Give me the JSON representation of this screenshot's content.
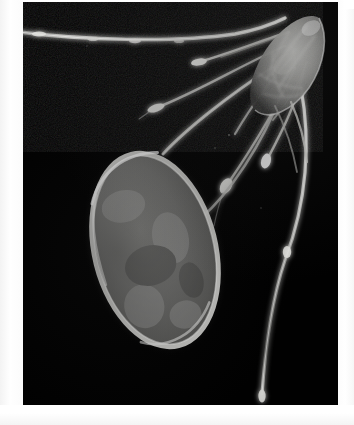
{
  "image": {
    "domain": "Natural-Image",
    "kind": "dark-field photomicrograph",
    "subject_label": "planktonic crustacean with ovoid egg sac",
    "orientation": "portrait",
    "border_style": "white photographic print border",
    "background_color": "#010101",
    "plate": {
      "x": 23,
      "y": 2,
      "width": 315,
      "height": 403
    },
    "canvas": {
      "width": 354,
      "height": 425
    }
  },
  "palette": {
    "paper_white": "#ffffff",
    "plate_black": "#010101",
    "specimen_bright": "#f2f2f0",
    "specimen_mid": "#b9b9b6",
    "specimen_dim": "#6e6e6c",
    "sac_interior": "#6a6a68",
    "sac_rim": "#e8e8e6",
    "halo": "#3a3a39"
  },
  "features": {
    "egg_sac": {
      "name": "ovoid egg sac",
      "center_x": 155,
      "center_y": 250,
      "radius_x": 62,
      "radius_y": 100,
      "rotation_deg": -14,
      "rim_brightness": "bright",
      "interior_tone": "granular mid-gray"
    },
    "cephalothorax": {
      "name": "head / body mass",
      "center_x": 283,
      "center_y": 62,
      "width": 72,
      "height": 74,
      "description": "translucent textured body with internal striations at upper right"
    },
    "horizontal_antenna": {
      "name": "long horizontal antenna",
      "from_x": 0,
      "from_y": 50,
      "to_x": 268,
      "to_y": 40,
      "description": "extends off the left edge of the plate, gently sagging"
    },
    "trailing_filament": {
      "name": "long trailing caudal filament",
      "from_x": 300,
      "from_y": 95,
      "to_x": 263,
      "to_y": 399,
      "knob_x": 262,
      "knob_y": 398,
      "description": "sweeps down the right side and ends in a small terminal knob"
    },
    "stalk": {
      "name": "connecting stalk",
      "from_x": 163,
      "from_y": 152,
      "to_x": 268,
      "to_y": 66,
      "description": "attaches egg sac to body"
    },
    "radiating_setae": [
      {
        "id": 1,
        "tip_x": 195,
        "tip_y": 62,
        "has_bulb": true,
        "label": "seta with bulbous tip (upper)"
      },
      {
        "id": 2,
        "tip_x": 152,
        "tip_y": 108,
        "has_bulb": true,
        "label": "seta with bulbous tip (mid-left)"
      },
      {
        "id": 3,
        "tip_x": 222,
        "tip_y": 189,
        "has_bulb": true,
        "label": "seta with bulbous tip (lower-center)"
      },
      {
        "id": 4,
        "tip_x": 262,
        "tip_y": 163,
        "has_bulb": true,
        "label": "seta with bulbous tip (lower-right)"
      },
      {
        "id": 5,
        "tip_x": 239,
        "tip_y": 136,
        "has_bulb": false,
        "label": "slender seta (inner)"
      },
      {
        "id": 6,
        "tip_x": 252,
        "tip_y": 118,
        "has_bulb": false,
        "label": "slender seta (outer)"
      }
    ]
  },
  "annotations": {
    "visible_text": "",
    "note": "No text, labels, scale bar or UI chrome appear in the image."
  }
}
